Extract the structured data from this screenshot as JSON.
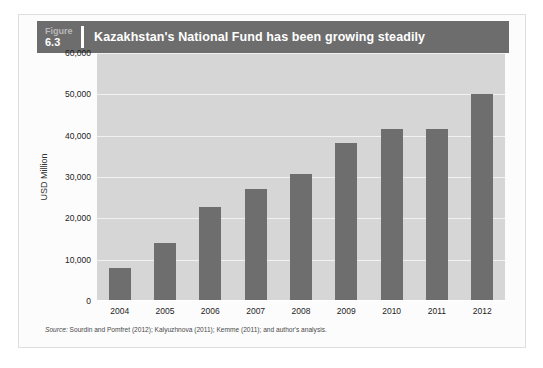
{
  "page": {
    "folio": "",
    "running_head": ""
  },
  "figure": {
    "number_word": "Figure",
    "number": "6.3",
    "title": "Kazakhstan's National Fund has been growing steadily",
    "source_label": "Source:",
    "source_text": " Sourdin and Pomfret (2012); Kalyuzhnova (2011); Kemme (2011); and author's analysis."
  },
  "colors": {
    "header_band": "#6d6d6d",
    "bar": "#6e6e6e",
    "plot_background": "#d6d6d6",
    "gridline": "#f1f1f1",
    "title_text": "#ffffff"
  },
  "chart_data": {
    "type": "bar",
    "title": "Kazakhstan's National Fund has been growing steadily",
    "xlabel": "",
    "ylabel": "USD Million",
    "categories": [
      "2004",
      "2005",
      "2006",
      "2007",
      "2008",
      "2009",
      "2010",
      "2011",
      "2012"
    ],
    "values": [
      8000,
      14000,
      22800,
      27000,
      30800,
      38300,
      41500,
      41700,
      50200
    ],
    "ylim": [
      0,
      60000
    ],
    "ytick_values": [
      0,
      10000,
      20000,
      30000,
      40000,
      50000,
      60000
    ],
    "ytick_labels": [
      "0",
      "10,000",
      "20,000",
      "30,000",
      "40,000",
      "50,000",
      "60,000"
    ],
    "grid": true,
    "legend": false,
    "legend_position": "none"
  }
}
